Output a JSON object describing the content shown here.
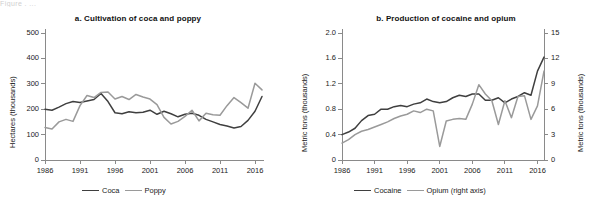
{
  "figure": {
    "caption_fragment": "Figure  .    ...",
    "colors": {
      "dark": "#3f3f3f",
      "light": "#9a9a9a",
      "axis": "#8a8a8a",
      "text": "#222222"
    }
  },
  "panels": [
    {
      "id": "a",
      "title": "a. Cultivation of coca and poppy",
      "ylabel": "Hectares (thousands)",
      "yticks": [
        "0",
        "100",
        "200",
        "300",
        "400",
        "500"
      ],
      "xticks": [
        "1986",
        "1991",
        "1996",
        "2001",
        "2006",
        "2011",
        "2016"
      ],
      "legend": [
        {
          "label": "Coca",
          "color": "#3f3f3f"
        },
        {
          "label": "Poppy",
          "color": "#9a9a9a"
        }
      ]
    },
    {
      "id": "b",
      "title": "b. Production of cocaine and opium",
      "ylabel": "Metric tons (thousands)",
      "ylabel_right": "Metric tons (thousands)",
      "yticks": [
        "0",
        "0.4",
        "0.8",
        "1.2",
        "1.6",
        "2.0"
      ],
      "yticks_right": [
        "0",
        "3",
        "6",
        "9",
        "12",
        "15"
      ],
      "xticks": [
        "1986",
        "1991",
        "1996",
        "2001",
        "2006",
        "2011",
        "2016"
      ],
      "legend": [
        {
          "label": "Cocaine",
          "color": "#3f3f3f"
        },
        {
          "label": "Opium (right axis)",
          "color": "#9a9a9a"
        }
      ]
    }
  ],
  "chart_data": [
    {
      "type": "line",
      "panel": "a",
      "title": "a. Cultivation of coca and poppy",
      "xlabel": "",
      "ylabel": "Hectares (thousands)",
      "xlim": [
        1986,
        2017
      ],
      "ylim": [
        0,
        500
      ],
      "grid": false,
      "legend_position": "bottom",
      "x": [
        1986,
        1987,
        1988,
        1989,
        1990,
        1991,
        1992,
        1993,
        1994,
        1995,
        1996,
        1997,
        1998,
        1999,
        2000,
        2001,
        2002,
        2003,
        2004,
        2005,
        2006,
        2007,
        2008,
        2009,
        2010,
        2011,
        2012,
        2013,
        2014,
        2015,
        2016,
        2017
      ],
      "series": [
        {
          "name": "Coca",
          "color": "#3f3f3f",
          "values": [
            200,
            196,
            208,
            222,
            230,
            226,
            232,
            238,
            262,
            230,
            186,
            182,
            190,
            186,
            188,
            196,
            180,
            192,
            182,
            170,
            180,
            184,
            176,
            160,
            150,
            140,
            134,
            126,
            132,
            156,
            192,
            250
          ]
        },
        {
          "name": "Poppy",
          "color": "#9a9a9a",
          "values": [
            128,
            122,
            150,
            160,
            152,
            214,
            254,
            246,
            266,
            268,
            240,
            250,
            238,
            258,
            248,
            240,
            218,
            168,
            142,
            152,
            172,
            196,
            154,
            184,
            178,
            176,
            214,
            246,
            226,
            204,
            302,
            276
          ]
        }
      ]
    },
    {
      "type": "line",
      "panel": "b",
      "title": "b. Production of cocaine and opium",
      "xlabel": "",
      "ylabel": "Metric tons (thousands)",
      "ylabel_right": "Metric tons (thousands)",
      "xlim": [
        1986,
        2017
      ],
      "ylim": [
        0,
        2.0
      ],
      "ylim_right": [
        0,
        15
      ],
      "grid": false,
      "legend_position": "bottom",
      "x": [
        1986,
        1987,
        1988,
        1989,
        1990,
        1991,
        1992,
        1993,
        1994,
        1995,
        1996,
        1997,
        1998,
        1999,
        2000,
        2001,
        2002,
        2003,
        2004,
        2005,
        2006,
        2007,
        2008,
        2009,
        2010,
        2011,
        2012,
        2013,
        2014,
        2015,
        2016,
        2017
      ],
      "series": [
        {
          "name": "Cocaine",
          "color": "#3f3f3f",
          "axis": "left",
          "values": [
            0.4,
            0.44,
            0.5,
            0.62,
            0.7,
            0.72,
            0.8,
            0.8,
            0.84,
            0.86,
            0.84,
            0.88,
            0.9,
            0.96,
            0.92,
            0.9,
            0.92,
            0.98,
            1.02,
            1.0,
            1.04,
            1.04,
            0.94,
            0.94,
            0.98,
            0.9,
            0.96,
            1.0,
            1.06,
            1.02,
            1.4,
            1.62
          ]
        },
        {
          "name": "Opium (right axis)",
          "color": "#9a9a9a",
          "axis": "right",
          "values": [
            2.0,
            2.4,
            3.0,
            3.4,
            3.6,
            3.9,
            4.2,
            4.5,
            4.9,
            5.2,
            5.4,
            5.8,
            5.6,
            6.0,
            5.8,
            1.6,
            4.6,
            4.8,
            4.9,
            4.8,
            6.6,
            8.9,
            7.8,
            7.0,
            4.2,
            7.0,
            5.0,
            7.5,
            7.6,
            4.8,
            6.4,
            10.5
          ]
        }
      ]
    }
  ]
}
